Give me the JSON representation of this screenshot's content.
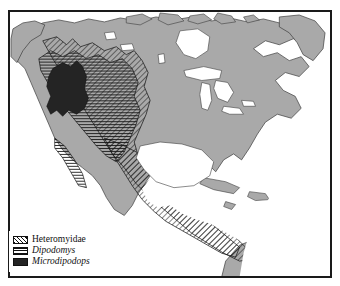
{
  "figure": {
    "kind": "distribution-map",
    "region": "North and Central America",
    "frame_color": "#1a1a1a",
    "ocean_color": "#ffffff",
    "land_color": "#a9a9a9",
    "border_line_color": "#3c3c3c"
  },
  "legend": {
    "items": [
      {
        "label": "Heteromyidae",
        "pattern": "diagonal-hatch",
        "italic": false,
        "color": "#111111"
      },
      {
        "label": "Dipodomys",
        "pattern": "horizontal-lines",
        "italic": true,
        "color": "#111111"
      },
      {
        "label": "Microdipodops",
        "pattern": "solid-fill",
        "italic": true,
        "color": "#242424"
      }
    ]
  },
  "map_features": {
    "labels": [],
    "water_bodies": [
      "Great Lakes",
      "Gulf of Mexico",
      "Caribbean Sea",
      "Hudson Bay",
      "Pacific Ocean",
      "Atlantic Ocean"
    ],
    "ranges": [
      {
        "taxon": "Heteromyidae",
        "extent": "western United States through Mexico and Central America"
      },
      {
        "taxon": "Dipodomys",
        "extent": "southwestern United States and northern Mexico"
      },
      {
        "taxon": "Microdipodops",
        "extent": "Great Basin, Nevada"
      }
    ]
  }
}
